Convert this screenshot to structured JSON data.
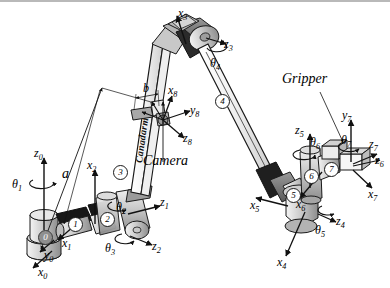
{
  "figure": {
    "brand_text": "Canadarm",
    "annotations": {
      "camera": "Camera",
      "gripper": "Gripper",
      "dim_a": "a",
      "dim_b": "b"
    },
    "colors": {
      "outline": "#1a1a1a",
      "metal_light": "#e2e2e2",
      "metal_mid": "#b0b0b0",
      "metal_dark": "#7c7c7c",
      "joint_black": "#1c1c1c",
      "background": "#ffffff",
      "border": "#b9b9b9"
    }
  },
  "links": [
    {
      "id": "0",
      "label": "0",
      "style": "dark"
    },
    {
      "id": "1",
      "label": "1",
      "style": "light"
    },
    {
      "id": "2",
      "label": "2",
      "style": "light"
    },
    {
      "id": "3",
      "label": "3",
      "style": "light"
    },
    {
      "id": "4",
      "label": "4",
      "style": "light"
    },
    {
      "id": "5",
      "label": "5",
      "style": "light"
    },
    {
      "id": "6",
      "label": "6",
      "style": "light"
    },
    {
      "id": "7",
      "label": "7",
      "style": "light"
    }
  ],
  "joint_angles": [
    {
      "name": "theta1",
      "base": "θ",
      "sub": "1"
    },
    {
      "name": "theta2",
      "base": "θ",
      "sub": "2"
    },
    {
      "name": "theta3",
      "base": "θ",
      "sub": "3"
    },
    {
      "name": "theta4",
      "base": "θ",
      "sub": "4"
    },
    {
      "name": "theta5",
      "base": "θ",
      "sub": "5"
    },
    {
      "name": "theta6",
      "base": "θ",
      "sub": "6"
    },
    {
      "name": "theta7",
      "base": "θ",
      "sub": "7"
    }
  ],
  "frame_axes": [
    {
      "name": "z0",
      "base": "z",
      "sub": "0"
    },
    {
      "name": "x0",
      "base": "x",
      "sub": "0"
    },
    {
      "name": "y0",
      "base": "y",
      "sub": "0"
    },
    {
      "name": "x1",
      "base": "x",
      "sub": "1"
    },
    {
      "name": "z1",
      "base": "z",
      "sub": "1"
    },
    {
      "name": "x2",
      "base": "x",
      "sub": "2"
    },
    {
      "name": "z2",
      "base": "z",
      "sub": "2"
    },
    {
      "name": "x3",
      "base": "x",
      "sub": "3"
    },
    {
      "name": "z3",
      "base": "z",
      "sub": "3"
    },
    {
      "name": "x4",
      "base": "x",
      "sub": "4"
    },
    {
      "name": "z4",
      "base": "z",
      "sub": "4"
    },
    {
      "name": "x5",
      "base": "x",
      "sub": "5"
    },
    {
      "name": "z5",
      "base": "z",
      "sub": "5"
    },
    {
      "name": "x6",
      "base": "x",
      "sub": "6"
    },
    {
      "name": "z6",
      "base": "z",
      "sub": "6"
    },
    {
      "name": "x7",
      "base": "x",
      "sub": "7"
    },
    {
      "name": "y7",
      "base": "y",
      "sub": "7"
    },
    {
      "name": "z7",
      "base": "z",
      "sub": "7"
    },
    {
      "name": "x8",
      "base": "x",
      "sub": "8"
    },
    {
      "name": "y8",
      "base": "y",
      "sub": "8"
    },
    {
      "name": "z8",
      "base": "z",
      "sub": "8"
    }
  ]
}
